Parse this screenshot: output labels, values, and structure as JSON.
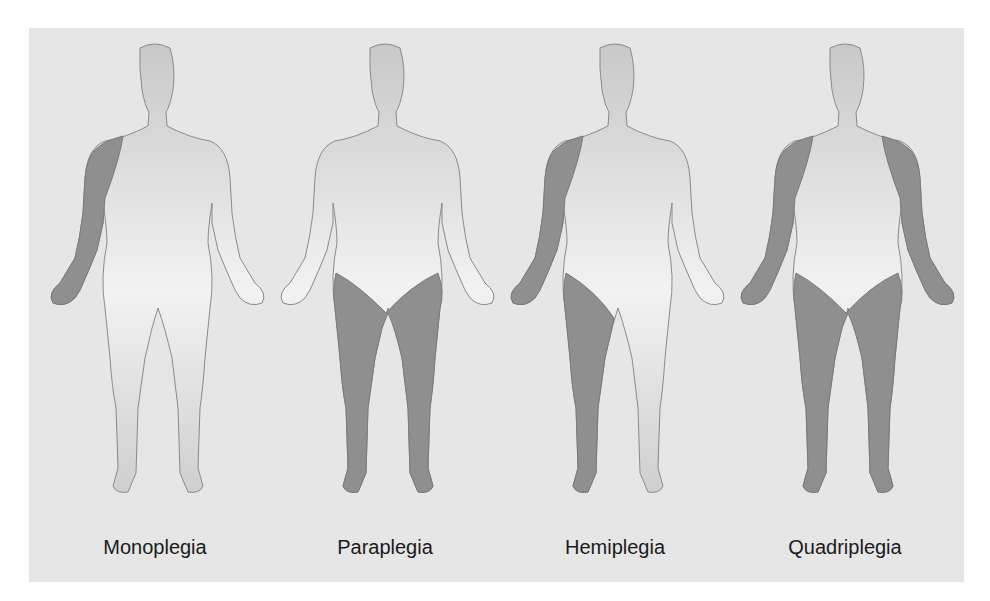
{
  "figure": {
    "panels": [
      {
        "label": "Monoplegia",
        "affected": [
          "right-arm"
        ]
      },
      {
        "label": "Paraplegia",
        "affected": [
          "left-leg",
          "right-leg"
        ]
      },
      {
        "label": "Hemiplegia",
        "affected": [
          "right-arm",
          "right-leg"
        ]
      },
      {
        "label": "Quadriplegia",
        "affected": [
          "left-arm",
          "right-arm",
          "left-leg",
          "right-leg"
        ]
      }
    ],
    "colors": {
      "background": "#e6e6e6",
      "body": "#d4d4d4",
      "body_light": "#efefef",
      "affected": "#8f8f8f",
      "outline": "#8a8a8a"
    }
  }
}
